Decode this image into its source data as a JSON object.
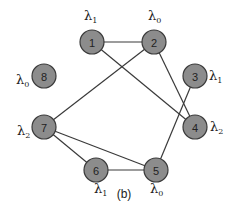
{
  "diagram": {
    "caption": "(b)",
    "colors": {
      "node_fill": "#8c8c8c",
      "stroke": "#3a3a3a",
      "background": "#ffffff"
    },
    "nodes": [
      {
        "id": "1",
        "label": "1",
        "x": 92,
        "y": 42,
        "lambda": "λ",
        "lambda_sub": "1",
        "lx": 84,
        "ly": 20
      },
      {
        "id": "2",
        "label": "2",
        "x": 154,
        "y": 42,
        "lambda": "λ",
        "lambda_sub": "0",
        "lx": 148,
        "ly": 20
      },
      {
        "id": "3",
        "label": "3",
        "x": 195,
        "y": 76,
        "lambda": "λ",
        "lambda_sub": "1",
        "lx": 209,
        "ly": 80
      },
      {
        "id": "4",
        "label": "4",
        "x": 195,
        "y": 127,
        "lambda": "λ",
        "lambda_sub": "2",
        "lx": 210,
        "ly": 131
      },
      {
        "id": "5",
        "label": "5",
        "x": 156,
        "y": 170,
        "lambda": "λ",
        "lambda_sub": "0",
        "lx": 150,
        "ly": 193
      },
      {
        "id": "6",
        "label": "6",
        "x": 96,
        "y": 170,
        "lambda": "λ",
        "lambda_sub": "1",
        "lx": 94,
        "ly": 193
      },
      {
        "id": "7",
        "label": "7",
        "x": 44,
        "y": 127,
        "lambda": "λ",
        "lambda_sub": "2",
        "lx": 17,
        "ly": 135
      },
      {
        "id": "8",
        "label": "8",
        "x": 44,
        "y": 76,
        "lambda": "λ",
        "lambda_sub": "0",
        "lx": 16,
        "ly": 84
      }
    ],
    "edges": [
      {
        "from": "1",
        "to": "2"
      },
      {
        "from": "1",
        "to": "4"
      },
      {
        "from": "2",
        "to": "7"
      },
      {
        "from": "2",
        "to": "4"
      },
      {
        "from": "3",
        "to": "5"
      },
      {
        "from": "7",
        "to": "6"
      },
      {
        "from": "7",
        "to": "5"
      },
      {
        "from": "6",
        "to": "5"
      }
    ]
  }
}
